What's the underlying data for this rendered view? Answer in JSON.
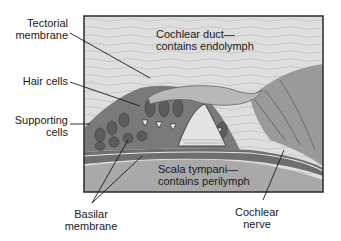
{
  "diagram": {
    "type": "anatomical-illustration",
    "labels": {
      "tectorial_membrane": [
        "Tectorial",
        "membrane"
      ],
      "hair_cells": [
        "Hair cells"
      ],
      "supporting_cells": [
        "Supporting",
        "cells"
      ],
      "basilar_membrane": [
        "Basilar",
        "membrane"
      ],
      "cochlear_nerve": [
        "Cochlear",
        "nerve"
      ]
    },
    "regions": {
      "cochlear_duct": [
        "Cochlear duct—",
        "contains endolymph"
      ],
      "scala_tympani": [
        "Scala tympani—",
        "contains perilymph"
      ]
    },
    "colors": {
      "frame": "#2a2a2a",
      "fluid_light": "#dcdcdc",
      "tissue_mid": "#8c8c8c",
      "tissue_dark": "#5a5a5a",
      "lower_fluid": "#a8a8a8"
    }
  }
}
